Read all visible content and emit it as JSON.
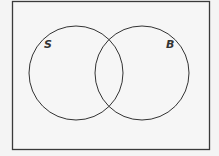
{
  "diagram": {
    "type": "venn",
    "sets": [
      {
        "label": "S"
      },
      {
        "label": "B"
      }
    ],
    "colors": {
      "stroke": "#333333",
      "background": "#f4f4f4"
    }
  }
}
